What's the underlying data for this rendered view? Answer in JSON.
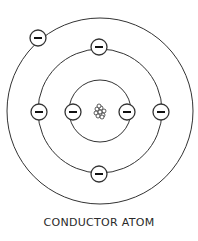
{
  "caption": "CONDUCTOR ATOM",
  "colors": {
    "stroke": "#333333",
    "background": "#ffffff"
  },
  "diagram": {
    "center": [
      100,
      111
    ],
    "orbits": [
      {
        "name": "inner",
        "radius": 31
      },
      {
        "name": "middle",
        "radius": 62
      },
      {
        "name": "outer",
        "radius": 93
      }
    ],
    "electrons": [
      {
        "orbit": "inner",
        "pos": [
          73,
          112
        ],
        "symbol": "−"
      },
      {
        "orbit": "inner",
        "pos": [
          127,
          112
        ],
        "symbol": "−"
      },
      {
        "orbit": "middle",
        "pos": [
          99,
          47
        ],
        "symbol": "−"
      },
      {
        "orbit": "middle",
        "pos": [
          39,
          112
        ],
        "symbol": "−"
      },
      {
        "orbit": "middle",
        "pos": [
          161,
          112
        ],
        "symbol": "−"
      },
      {
        "orbit": "middle",
        "pos": [
          99,
          174
        ],
        "symbol": "−"
      },
      {
        "orbit": "outer",
        "pos": [
          38,
          38
        ],
        "symbol": "−"
      }
    ],
    "nucleus": {
      "pos": [
        100,
        112
      ]
    }
  }
}
